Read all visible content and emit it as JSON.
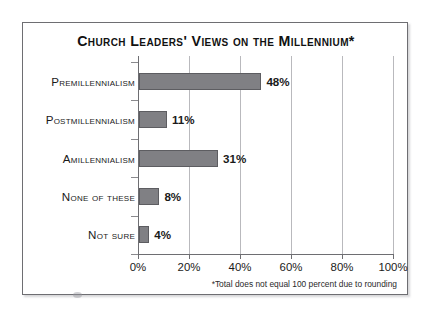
{
  "chart_data": {
    "type": "bar",
    "orientation": "horizontal",
    "title": "Church Leaders' Views on the Millennium*",
    "xlabel": "",
    "ylabel": "",
    "categories": [
      "Premillennialism",
      "Postmillennialism",
      "Amillennialism",
      "None of these",
      "Not sure"
    ],
    "values": [
      48,
      11,
      31,
      8,
      4
    ],
    "value_labels": [
      "48%",
      "11%",
      "31%",
      "8%",
      "4%"
    ],
    "xlim": [
      0,
      100
    ],
    "xticks": [
      0,
      20,
      40,
      60,
      80,
      100
    ],
    "xtick_labels": [
      "0%",
      "20%",
      "40%",
      "60%",
      "80%",
      "100%"
    ],
    "grid": true,
    "legend": false,
    "annotation": "*Total does not equal 100 percent due to rounding",
    "bar_color": "#808084",
    "bar_edge_color": "#5d5d61",
    "frame_color": "#6e6e72",
    "gridline_color": "#b9b9bd",
    "background": "#ffffff"
  }
}
